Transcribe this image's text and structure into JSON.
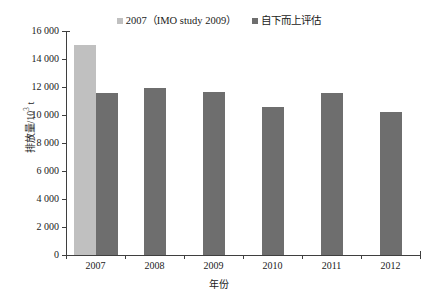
{
  "chart_data": {
    "type": "bar",
    "title": "",
    "subtitle": "",
    "xlabel": "年份",
    "ylabel": "排放量/10³ t",
    "categories": [
      "2007",
      "2008",
      "2009",
      "2010",
      "2011",
      "2012"
    ],
    "ylim": [
      0,
      16000
    ],
    "ytick_step": 2000,
    "ytick_labels": [
      "0",
      "2 000",
      "4 000",
      "6 000",
      "8 000",
      "10 000",
      "12 000",
      "14 000",
      "16 000"
    ],
    "ytick_values": [
      0,
      2000,
      4000,
      6000,
      8000,
      10000,
      12000,
      14000,
      16000
    ],
    "grid": false,
    "legend_position": "top-center",
    "series": [
      {
        "name": "2007（IMO study 2009）",
        "color": "#c0c0c0",
        "values": [
          15000,
          null,
          null,
          null,
          null,
          null
        ]
      },
      {
        "name": "自下而上评估",
        "color": "#6e6e6e",
        "values": [
          11600,
          11900,
          11650,
          10550,
          11600,
          10200
        ]
      }
    ]
  },
  "axis": {
    "y_title_main": "排放量/10",
    "y_title_exp": "3",
    "y_title_unit": " t",
    "x_title": "年份"
  },
  "legend": {
    "items": [
      {
        "label": "2007（IMO study 2009）",
        "color": "#c0c0c0"
      },
      {
        "label": "自下而上评估",
        "color": "#6e6e6e"
      }
    ]
  }
}
